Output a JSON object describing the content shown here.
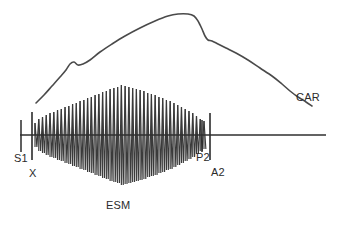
{
  "figure": {
    "width": 337,
    "height": 225,
    "background_color": "#ffffff",
    "line_color": "#3a3a3a",
    "baseline_color": "#2f2f2f"
  },
  "labels": {
    "s1": "S1",
    "x": "X",
    "p2": "P2",
    "a2": "A2",
    "esm": "ESM",
    "car": "CAR"
  },
  "chart_data": {
    "type": "line",
    "xlabel": "",
    "ylabel": "",
    "grid": false,
    "legend": "none",
    "xlim": [
      0,
      337
    ],
    "ylim": [
      225,
      0
    ],
    "baseline": {
      "name": "phonocardiogram-baseline",
      "y": 135,
      "x_start": 20,
      "x_end": 326
    },
    "annotations": [
      {
        "name": "s1",
        "label": "S1",
        "x": 21,
        "y_top": 120,
        "y_bottom": 152,
        "marker": "short-tick",
        "label_x": 14,
        "label_y": 153
      },
      {
        "name": "x",
        "label": "X",
        "x": 32,
        "y_top": 112,
        "y_bottom": 160,
        "marker": "tall-line",
        "label_x": 29,
        "label_y": 168
      },
      {
        "name": "p2",
        "label": "P2",
        "x": 202,
        "y_top": 120,
        "y_bottom": 152,
        "marker": "short-tick",
        "label_x": 196,
        "label_y": 152
      },
      {
        "name": "a2",
        "label": "A2",
        "x": 210,
        "y_top": 113,
        "y_bottom": 160,
        "marker": "tall-line",
        "label_x": 211,
        "label_y": 167
      },
      {
        "name": "esm",
        "label": "ESM",
        "x": 118,
        "y": 200,
        "marker": "text-only",
        "label_x": 106,
        "label_y": 200
      },
      {
        "name": "car",
        "label": "CAR",
        "x": 302,
        "y": 92,
        "marker": "text-only",
        "label_x": 296,
        "label_y": 92
      }
    ],
    "series": [
      {
        "name": "CAR",
        "description": "Carotid arterial pulse tracing with anacrotic shoulder, rounded plateau peak and dicrotic notch",
        "x": [
          36,
          44,
          52,
          60,
          66,
          70,
          74,
          78,
          83,
          90,
          100,
          112,
          125,
          140,
          155,
          168,
          178,
          188,
          194,
          198,
          202,
          205,
          208,
          212,
          218,
          226,
          236,
          248,
          260,
          272,
          282,
          290,
          298,
          306,
          312
        ],
        "y": [
          103,
          95,
          86,
          77,
          70,
          64,
          62,
          65,
          64,
          60,
          52,
          44,
          36,
          28,
          21,
          16,
          14,
          14,
          16,
          21,
          29,
          36,
          40,
          41,
          44,
          48,
          53,
          60,
          68,
          76,
          84,
          91,
          97,
          102,
          106
        ]
      },
      {
        "name": "ESM",
        "description": "Ejection systolic murmur, diamond-shaped (crescendo-decrescendo) oscillations about the baseline between X and P2",
        "envelope_type": "diamond",
        "x_start": 35,
        "x_peak": 120,
        "x_end": 204,
        "baseline_y": 135,
        "amplitude_start": 12,
        "amplitude_peak": 50,
        "amplitude_end": 14,
        "spike_count": 46,
        "amplitudes": [
          12,
          16,
          18,
          20,
          22,
          23,
          25,
          26,
          28,
          29,
          31,
          32,
          34,
          35,
          37,
          38,
          40,
          41,
          43,
          44,
          46,
          47,
          48,
          50,
          49,
          48,
          47,
          46,
          45,
          44,
          42,
          41,
          40,
          38,
          37,
          35,
          34,
          32,
          30,
          28,
          26,
          24,
          22,
          19,
          16,
          14
        ]
      }
    ]
  }
}
